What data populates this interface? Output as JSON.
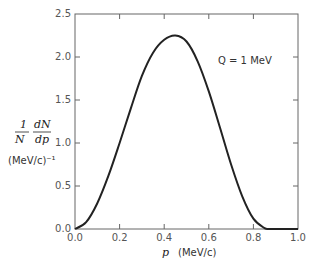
{
  "chart_data": {
    "type": "line",
    "title": "",
    "xlabel": "p (MeV/c)",
    "ylabel": "1/N dN/dp (MeV/c)^-1",
    "xlim": [
      0.0,
      1.0
    ],
    "ylim": [
      0.0,
      2.5
    ],
    "xticks": [
      "0.0",
      "0.2",
      "0.4",
      "0.6",
      "0.8",
      "1.0"
    ],
    "yticks": [
      "0.0",
      "0.5",
      "1.0",
      "1.5",
      "2.0",
      "2.5"
    ],
    "grid": false,
    "annotation": "Q = 1 MeV",
    "series": [
      {
        "name": "Q = 1 MeV",
        "x": [
          0.0,
          0.05,
          0.1,
          0.15,
          0.2,
          0.25,
          0.3,
          0.35,
          0.4,
          0.45,
          0.5,
          0.55,
          0.6,
          0.65,
          0.7,
          0.75,
          0.8,
          0.85,
          0.87,
          0.9,
          1.0
        ],
        "y": [
          0.0,
          0.08,
          0.3,
          0.62,
          1.0,
          1.4,
          1.78,
          2.05,
          2.2,
          2.25,
          2.18,
          1.95,
          1.6,
          1.18,
          0.75,
          0.38,
          0.12,
          0.01,
          0.0,
          0.0,
          0.0
        ]
      }
    ]
  },
  "labels": {
    "annotation": "Q = 1 MeV",
    "y_frac_num": "1",
    "y_frac_den": "N",
    "y_deriv_num": "dN",
    "y_deriv_den": "dp",
    "y_units": "(MeV/c)⁻¹",
    "x_var": "p",
    "x_units": "(MeV/c)"
  }
}
